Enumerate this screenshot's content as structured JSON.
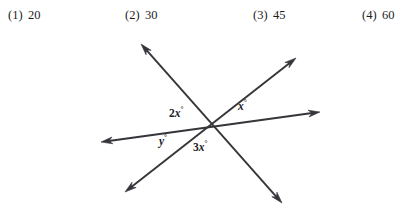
{
  "choices": [
    {
      "tag": "(1)",
      "value": "20"
    },
    {
      "tag": "(2)",
      "value": "30"
    },
    {
      "tag": "(3)",
      "value": "45"
    },
    {
      "tag": "(4)",
      "value": "60"
    }
  ],
  "figure": {
    "type": "geometry-diagram",
    "intersection_point": {
      "x": 213,
      "y": 99
    },
    "stroke_color": "#35353a",
    "background_color": "#ffffff",
    "lines": [
      {
        "name": "line-upper-left-to-lower-right",
        "from": {
          "x": 141,
          "y": 16
        },
        "to": {
          "x": 282,
          "y": 175
        },
        "arrow_start": true,
        "arrow_end": true
      },
      {
        "name": "line-lower-left-to-upper-right",
        "from": {
          "x": 125,
          "y": 164
        },
        "to": {
          "x": 296,
          "y": 30
        },
        "arrow_start": true,
        "arrow_end": true
      },
      {
        "name": "line-left-to-right",
        "from": {
          "x": 101,
          "y": 114
        },
        "to": {
          "x": 320,
          "y": 84
        },
        "arrow_start": true,
        "arrow_end": true
      }
    ],
    "angle_labels": [
      {
        "name": "angle-2x",
        "coefficient": "2",
        "variable": "x",
        "unit": "°",
        "text": "2x°"
      },
      {
        "name": "angle-x",
        "coefficient": "",
        "variable": "x",
        "unit": "°",
        "text": "x°"
      },
      {
        "name": "angle-y",
        "coefficient": "",
        "variable": "y",
        "unit": "°",
        "text": "y°"
      },
      {
        "name": "angle-3x",
        "coefficient": "3",
        "variable": "x",
        "unit": "°",
        "text": "3x°"
      }
    ]
  }
}
